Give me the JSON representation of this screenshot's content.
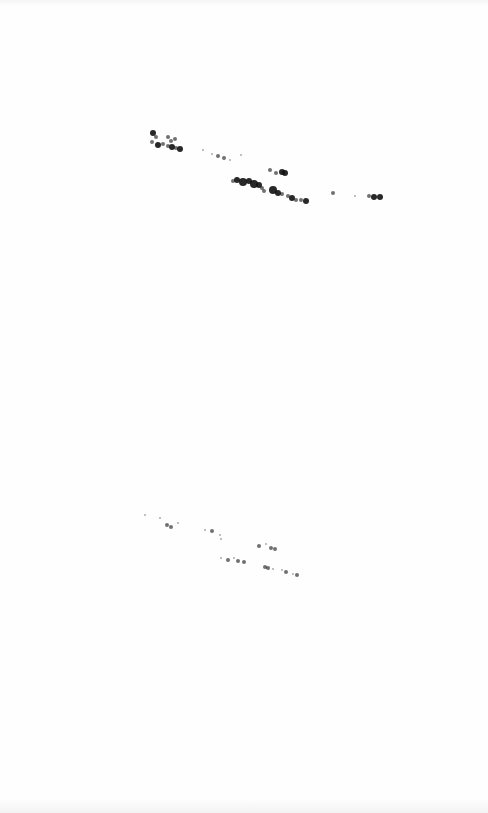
{
  "image": {
    "description": "Faint scanned image of two diagonal clusters of dark dots (like birds or specks) on a white background",
    "background": "#fefefe",
    "dot_color": "#111111",
    "clusters": [
      {
        "name": "upper-cluster",
        "dots": [
          [
            153,
            133,
            3
          ],
          [
            156,
            137,
            2
          ],
          [
            152,
            142,
            2
          ],
          [
            158,
            145,
            3
          ],
          [
            163,
            144,
            2
          ],
          [
            168,
            146,
            2
          ],
          [
            172,
            147,
            3
          ],
          [
            176,
            148,
            2
          ],
          [
            180,
            149,
            3
          ],
          [
            175,
            139,
            2
          ],
          [
            171,
            141,
            2
          ],
          [
            168,
            137,
            2
          ],
          [
            203,
            150,
            1
          ],
          [
            212,
            154,
            1
          ],
          [
            218,
            156,
            2
          ],
          [
            224,
            158,
            2
          ],
          [
            230,
            160,
            1
          ],
          [
            241,
            155,
            1
          ],
          [
            270,
            170,
            2
          ],
          [
            276,
            173,
            2
          ],
          [
            282,
            172,
            3
          ],
          [
            285,
            173,
            3
          ],
          [
            233,
            181,
            2
          ],
          [
            237,
            180,
            3
          ],
          [
            243,
            182,
            4
          ],
          [
            249,
            181,
            3
          ],
          [
            254,
            184,
            4
          ],
          [
            259,
            185,
            3
          ],
          [
            262,
            188,
            2
          ],
          [
            264,
            191,
            2
          ],
          [
            273,
            190,
            4
          ],
          [
            278,
            193,
            3
          ],
          [
            282,
            194,
            2
          ],
          [
            288,
            196,
            2
          ],
          [
            292,
            198,
            3
          ],
          [
            296,
            200,
            2
          ],
          [
            301,
            200,
            2
          ],
          [
            306,
            201,
            3
          ],
          [
            333,
            193,
            2
          ],
          [
            355,
            196,
            1
          ],
          [
            369,
            196,
            2
          ],
          [
            374,
            197,
            3
          ],
          [
            380,
            197,
            3
          ]
        ]
      },
      {
        "name": "lower-cluster",
        "dots": [
          [
            145,
            515,
            1
          ],
          [
            160,
            518,
            1
          ],
          [
            167,
            525,
            2
          ],
          [
            171,
            527,
            2
          ],
          [
            178,
            523,
            1
          ],
          [
            205,
            530,
            1
          ],
          [
            212,
            531,
            2
          ],
          [
            220,
            535,
            1
          ],
          [
            221,
            539,
            1
          ],
          [
            259,
            546,
            2
          ],
          [
            266,
            544,
            1
          ],
          [
            271,
            548,
            2
          ],
          [
            275,
            549,
            2
          ],
          [
            221,
            558,
            1
          ],
          [
            228,
            560,
            2
          ],
          [
            234,
            558,
            1
          ],
          [
            238,
            561,
            2
          ],
          [
            244,
            562,
            2
          ],
          [
            265,
            567,
            2
          ],
          [
            268,
            568,
            2
          ],
          [
            273,
            569,
            1
          ],
          [
            282,
            570,
            1
          ],
          [
            286,
            572,
            2
          ],
          [
            293,
            574,
            1
          ],
          [
            297,
            575,
            2
          ]
        ]
      }
    ]
  }
}
